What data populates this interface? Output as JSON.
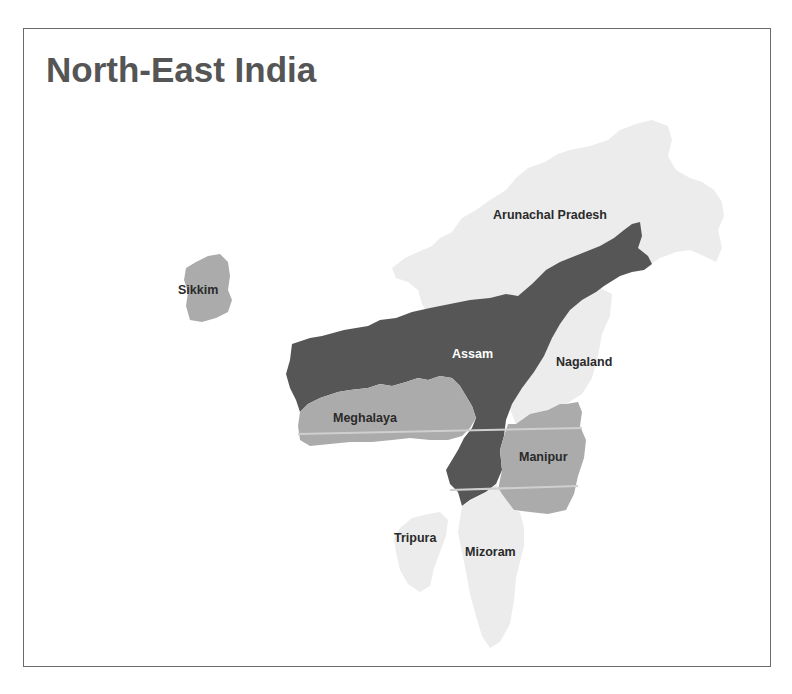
{
  "title": "North-East India",
  "colors": {
    "light": "#ececec",
    "medium": "#ababab",
    "dark": "#565656",
    "label_dark": "#2a2a2a",
    "label_light": "#ffffff"
  },
  "states": [
    {
      "name": "Arunachal Pradesh",
      "shade": "light"
    },
    {
      "name": "Sikkim",
      "shade": "medium"
    },
    {
      "name": "Assam",
      "shade": "dark"
    },
    {
      "name": "Nagaland",
      "shade": "light"
    },
    {
      "name": "Meghalaya",
      "shade": "medium"
    },
    {
      "name": "Manipur",
      "shade": "medium"
    },
    {
      "name": "Tripura",
      "shade": "light"
    },
    {
      "name": "Mizoram",
      "shade": "light"
    }
  ]
}
